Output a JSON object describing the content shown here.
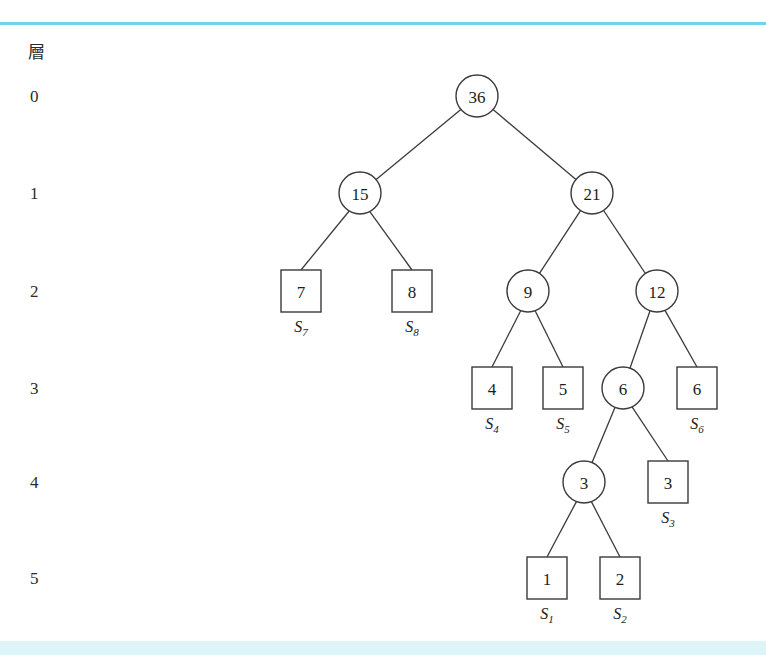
{
  "figure": {
    "level_axis_header": "層",
    "levels": [
      {
        "label": "0",
        "y": 96
      },
      {
        "label": "1",
        "y": 193
      },
      {
        "label": "2",
        "y": 291
      },
      {
        "label": "3",
        "y": 388
      },
      {
        "label": "4",
        "y": 482
      },
      {
        "label": "5",
        "y": 578
      }
    ],
    "colors": {
      "rule_top": "#6fd6ea",
      "rule_bottom": "#ddf5f8",
      "stroke": "#3a3a3a",
      "text": "#1d1d1d",
      "node_fill": "#ffffff"
    },
    "internal_nodes": [
      {
        "id": "n36",
        "value": "36",
        "x": 477,
        "y": 96,
        "r": 21,
        "level": 0
      },
      {
        "id": "n15",
        "value": "15",
        "x": 360,
        "y": 193,
        "r": 21,
        "level": 1
      },
      {
        "id": "n21",
        "value": "21",
        "x": 592,
        "y": 193,
        "r": 21,
        "level": 1
      },
      {
        "id": "n9",
        "value": "9",
        "x": 528,
        "y": 291,
        "r": 21,
        "level": 2
      },
      {
        "id": "n12",
        "value": "12",
        "x": 657,
        "y": 291,
        "r": 21,
        "level": 2
      },
      {
        "id": "n6",
        "value": "6",
        "x": 623,
        "y": 388,
        "r": 21,
        "level": 3
      },
      {
        "id": "n3",
        "value": "3",
        "x": 584,
        "y": 482,
        "r": 21,
        "level": 4
      }
    ],
    "leaf_nodes": [
      {
        "id": "l7",
        "value": "7",
        "symbol": "S",
        "subscript": "7",
        "x": 301,
        "y": 291,
        "w": 40,
        "h": 42,
        "level": 2
      },
      {
        "id": "l8",
        "value": "8",
        "symbol": "S",
        "subscript": "8",
        "x": 412,
        "y": 291,
        "w": 40,
        "h": 42,
        "level": 2
      },
      {
        "id": "l4",
        "value": "4",
        "symbol": "S",
        "subscript": "4",
        "x": 492,
        "y": 388,
        "w": 40,
        "h": 42,
        "level": 3
      },
      {
        "id": "l5",
        "value": "5",
        "symbol": "S",
        "subscript": "5",
        "x": 563,
        "y": 388,
        "w": 40,
        "h": 42,
        "level": 3
      },
      {
        "id": "l6",
        "value": "6",
        "symbol": "S",
        "subscript": "6",
        "x": 697,
        "y": 388,
        "w": 40,
        "h": 42,
        "level": 3
      },
      {
        "id": "l3",
        "value": "3",
        "symbol": "S",
        "subscript": "3",
        "x": 668,
        "y": 482,
        "w": 40,
        "h": 42,
        "level": 4
      },
      {
        "id": "l1",
        "value": "1",
        "symbol": "S",
        "subscript": "1",
        "x": 547,
        "y": 578,
        "w": 40,
        "h": 42,
        "level": 5
      },
      {
        "id": "l2",
        "value": "2",
        "symbol": "S",
        "subscript": "2",
        "x": 620,
        "y": 578,
        "w": 40,
        "h": 42,
        "level": 5
      }
    ],
    "edges": [
      {
        "from": "n36",
        "to": "n15"
      },
      {
        "from": "n36",
        "to": "n21"
      },
      {
        "from": "n15",
        "to": "l7"
      },
      {
        "from": "n15",
        "to": "l8"
      },
      {
        "from": "n21",
        "to": "n9"
      },
      {
        "from": "n21",
        "to": "n12"
      },
      {
        "from": "n9",
        "to": "l4"
      },
      {
        "from": "n9",
        "to": "l5"
      },
      {
        "from": "n12",
        "to": "n6"
      },
      {
        "from": "n12",
        "to": "l6"
      },
      {
        "from": "n6",
        "to": "n3"
      },
      {
        "from": "n6",
        "to": "l3"
      },
      {
        "from": "n3",
        "to": "l1"
      },
      {
        "from": "n3",
        "to": "l2"
      }
    ]
  }
}
